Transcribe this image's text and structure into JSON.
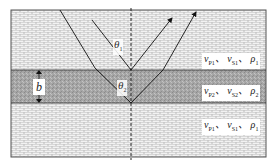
{
  "figure": {
    "layers": [
      {
        "name": "upper-layer",
        "vp": "v",
        "vp_sub": "P1",
        "vs": "v",
        "vs_sub": "S1",
        "rho": "ρ",
        "rho_sub": "1",
        "sep": "、"
      },
      {
        "name": "middle-layer",
        "vp": "v",
        "vp_sub": "P2",
        "vs": "v",
        "vs_sub": "S2",
        "rho": "ρ",
        "rho_sub": "2",
        "sep": "、"
      },
      {
        "name": "lower-layer",
        "vp": "v",
        "vp_sub": "P1",
        "vs": "v",
        "vs_sub": "S1",
        "rho": "ρ",
        "rho_sub": "1",
        "sep": "、"
      }
    ],
    "theta1": {
      "sym": "θ",
      "sub": "1"
    },
    "theta2": {
      "sym": "θ",
      "sub": "2"
    },
    "thickness_label": "b",
    "colors": {
      "brick_bg": "#d9d9d9",
      "brick_mortar": "#ffffff",
      "middle_layer": "#a8a8a8",
      "line": "#222222"
    }
  }
}
